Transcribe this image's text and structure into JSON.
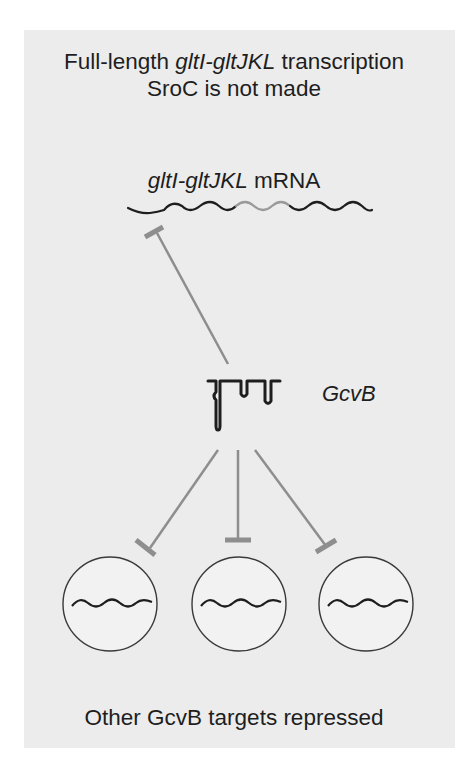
{
  "title": {
    "line1_prefix": "Full-length ",
    "line1_gene": "gltI-gltJKL",
    "line1_suffix": " transcription",
    "line2": "SroC is not made"
  },
  "mrna": {
    "gene": "gltI-gltJKL",
    "suffix": " mRNA"
  },
  "srna": {
    "label": "GcvB"
  },
  "targets": {
    "count": 3,
    "caption": "Other GcvB targets repressed"
  },
  "colors": {
    "background_panel": "#ececec",
    "text": "#1e1e1e",
    "rna_dark": "#1e1e1e",
    "rna_highlight": "#9a9a9a",
    "inhibition": "#8e8e8e",
    "circle_stroke": "#3a3a3a",
    "circle_fill": "#f2f2f2"
  }
}
